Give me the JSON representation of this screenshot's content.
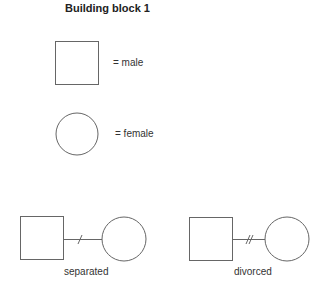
{
  "title": "Building block 1",
  "legend": {
    "male": {
      "symbol": "square",
      "label": "= male"
    },
    "female": {
      "symbol": "circle",
      "label": "= female"
    }
  },
  "relationships": [
    {
      "type": "separated",
      "label": "separated",
      "marker": "single-slash"
    },
    {
      "type": "divorced",
      "label": "divorced",
      "marker": "double-slash"
    }
  ]
}
